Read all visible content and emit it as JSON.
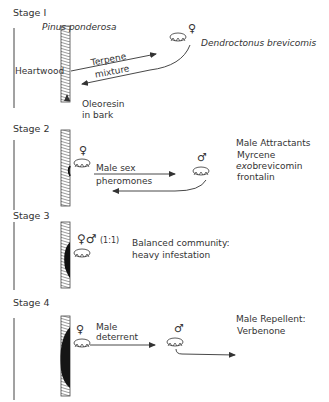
{
  "figure": {
    "stages": [
      {
        "label": "Stage I",
        "tree_name": "Pinus ponderosa",
        "heartwood_label": "Heartwood",
        "arrow_out_label_1": "Terpene",
        "arrow_out_label_2": "mixture",
        "insect_symbol": "♀",
        "insect_name": "Dendroctonus brevicomis",
        "bark_label_1": "Oleoresin",
        "bark_label_2": "in bark"
      },
      {
        "label": "Stage 2",
        "female_symbol": "♀",
        "arrow_label_1": "Male sex",
        "arrow_label_2": "pheromones",
        "male_symbol": "♂",
        "side_heading": "Male Attractants",
        "side_items": [
          "Myrcene",
          "exo",
          "brevicomin",
          "frontalin"
        ]
      },
      {
        "label": "Stage 3",
        "symbols": "♀♂",
        "ratio": "(1:1)",
        "note_1": "Balanced community:",
        "note_2": "heavy infestation"
      },
      {
        "label": "Stage 4",
        "female_symbol": "♀",
        "arrow_label_1": "Male",
        "arrow_label_2": "deterrent",
        "male_symbol": "♂",
        "side_heading": "Male Repellent:",
        "side_item": "Verbenone"
      }
    ],
    "colors": {
      "ink": "#333333",
      "background": "#ffffff",
      "infestation": "#1a1a1a"
    }
  }
}
